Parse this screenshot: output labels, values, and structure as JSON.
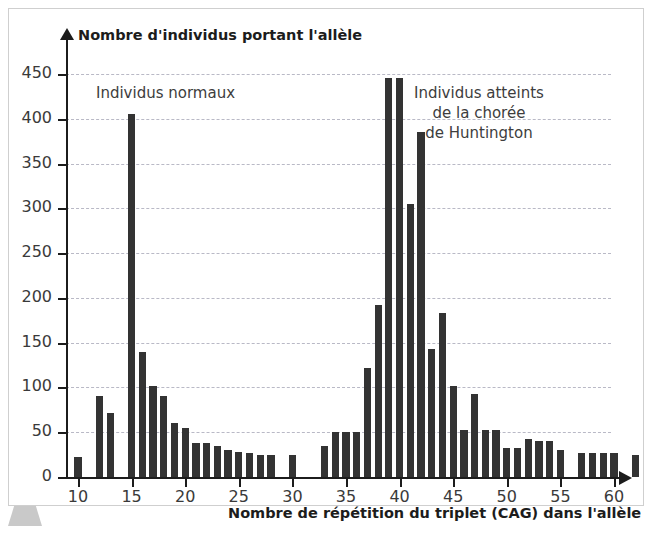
{
  "figure": {
    "border_color": "#cfcfcf",
    "background": "#ffffff",
    "bar_color": "#333333",
    "grid_color": "#b9b9c6"
  },
  "annotations": {
    "left_group": "Individus normaux",
    "right_group": "Individus atteints\nde la chorée\nde Huntington"
  },
  "chart_data": {
    "type": "bar",
    "title": "",
    "ylabel": "Nombre d'individus portant l'allèle",
    "xlabel": "Nombre de répétition du triplet (CAG) dans l'allèle",
    "ylim": [
      0,
      470
    ],
    "xlim": [
      8.5,
      63.5
    ],
    "grid": true,
    "legend_position": "none",
    "ytick_labels": [
      "0",
      "50",
      "100",
      "150",
      "200",
      "250",
      "300",
      "350",
      "400",
      "450"
    ],
    "yticks": [
      0,
      50,
      100,
      150,
      200,
      250,
      300,
      350,
      400,
      450
    ],
    "xtick_labels": [
      "10",
      "15",
      "20",
      "25",
      "30",
      "35",
      "40",
      "45",
      "50",
      "55",
      "60"
    ],
    "xticks": [
      10,
      15,
      20,
      25,
      30,
      35,
      40,
      45,
      50,
      55,
      60
    ],
    "categories": [
      10,
      11,
      12,
      13,
      14,
      15,
      16,
      17,
      18,
      19,
      20,
      21,
      22,
      23,
      24,
      25,
      26,
      27,
      28,
      29,
      30,
      31,
      32,
      33,
      34,
      35,
      36,
      37,
      38,
      39,
      40,
      41,
      42,
      43,
      44,
      45,
      46,
      47,
      48,
      49,
      50,
      51,
      52,
      53,
      54,
      55,
      56,
      57,
      58,
      59,
      60,
      61,
      62
    ],
    "values": [
      22,
      0,
      90,
      72,
      0,
      405,
      140,
      102,
      90,
      60,
      55,
      38,
      38,
      35,
      30,
      28,
      27,
      25,
      25,
      0,
      25,
      0,
      0,
      35,
      50,
      50,
      50,
      122,
      192,
      445,
      445,
      305,
      385,
      143,
      183,
      102,
      52,
      93,
      52,
      52,
      32,
      32,
      42,
      40,
      40,
      30,
      0,
      27,
      27,
      27,
      27,
      0,
      25
    ]
  }
}
